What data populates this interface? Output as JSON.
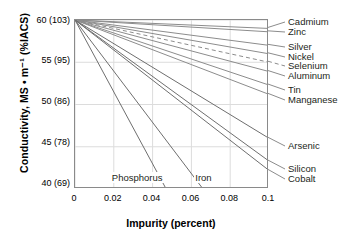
{
  "chart_data": {
    "type": "line",
    "title": "",
    "xlabel": "Impurity (percent)",
    "ylabel": "Conductivity, MS • m⁻¹ (%IACS)",
    "xlim": [
      0,
      0.1
    ],
    "ylim": [
      40,
      60
    ],
    "xticks": [
      "0",
      "0.02",
      "0.04",
      "0.06",
      "0.08",
      "0.1"
    ],
    "xtick_values": [
      0,
      0.02,
      0.04,
      0.06,
      0.08,
      0.1
    ],
    "yticks": [
      "60 (103)",
      "55 (95)",
      "50 (86)",
      "45 (78)",
      "40 (69)"
    ],
    "ytick_values": [
      60,
      55,
      50,
      45,
      40
    ],
    "grid": true,
    "legend": "right-side inline labels",
    "origin_note": "All series start at x=0, y=60 (103 %IACS)",
    "series": [
      {
        "name": "Cadmium",
        "x": [
          0,
          0.1
        ],
        "y": [
          60,
          59.0
        ],
        "style": "solid"
      },
      {
        "name": "Zinc",
        "x": [
          0,
          0.1
        ],
        "y": [
          60,
          58.6
        ],
        "style": "solid"
      },
      {
        "name": "Silver",
        "x": [
          0,
          0.1
        ],
        "y": [
          60,
          57.0
        ],
        "style": "solid"
      },
      {
        "name": "Nickel",
        "x": [
          0,
          0.1
        ],
        "y": [
          60,
          56.0
        ],
        "style": "solid"
      },
      {
        "name": "Selenium",
        "x": [
          0,
          0.1
        ],
        "y": [
          60,
          55.0
        ],
        "style": "dashed"
      },
      {
        "name": "Aluminum",
        "x": [
          0,
          0.1
        ],
        "y": [
          60,
          53.9
        ],
        "style": "solid"
      },
      {
        "name": "Tin",
        "x": [
          0,
          0.1
        ],
        "y": [
          60,
          52.3
        ],
        "style": "solid"
      },
      {
        "name": "Manganese",
        "x": [
          0,
          0.1
        ],
        "y": [
          60,
          51.2
        ],
        "style": "solid"
      },
      {
        "name": "Arsenic",
        "x": [
          0,
          0.1
        ],
        "y": [
          60,
          46.0
        ],
        "style": "solid"
      },
      {
        "name": "Silicon",
        "x": [
          0,
          0.1
        ],
        "y": [
          60,
          43.3
        ],
        "style": "solid"
      },
      {
        "name": "Cobalt",
        "x": [
          0,
          0.1
        ],
        "y": [
          60,
          42.2
        ],
        "style": "solid"
      },
      {
        "name": "Phosphorus",
        "x": [
          0,
          0.047
        ],
        "y": [
          60,
          40.0
        ],
        "style": "solid"
      },
      {
        "name": "Iron",
        "x": [
          0,
          0.066
        ],
        "y": [
          60,
          40.0
        ],
        "style": "solid"
      }
    ],
    "inline_labels": [
      {
        "text": "Phosphorus",
        "x": 0.019,
        "y": 41.2
      },
      {
        "text": "Iron",
        "x": 0.062,
        "y": 41.2
      }
    ],
    "colors": {
      "line": "#8c8c8c",
      "line_dark": "#6e6e6e",
      "grid": "#dcdcdc",
      "axis": "#8a8a8a",
      "text": "#231f20"
    }
  },
  "series_labels": [
    {
      "name": "Cadmium",
      "top": 17
    },
    {
      "name": "Zinc",
      "top": 27
    },
    {
      "name": "Silver",
      "top": 42
    },
    {
      "name": "Nickel",
      "top": 52
    },
    {
      "name": "Selenium",
      "top": 61
    },
    {
      "name": "Aluminum",
      "top": 71
    },
    {
      "name": "Tin",
      "top": 85
    },
    {
      "name": "Manganese",
      "top": 95
    },
    {
      "name": "Arsenic",
      "top": 141
    },
    {
      "name": "Silicon",
      "top": 164
    },
    {
      "name": "Cobalt",
      "top": 174
    }
  ]
}
